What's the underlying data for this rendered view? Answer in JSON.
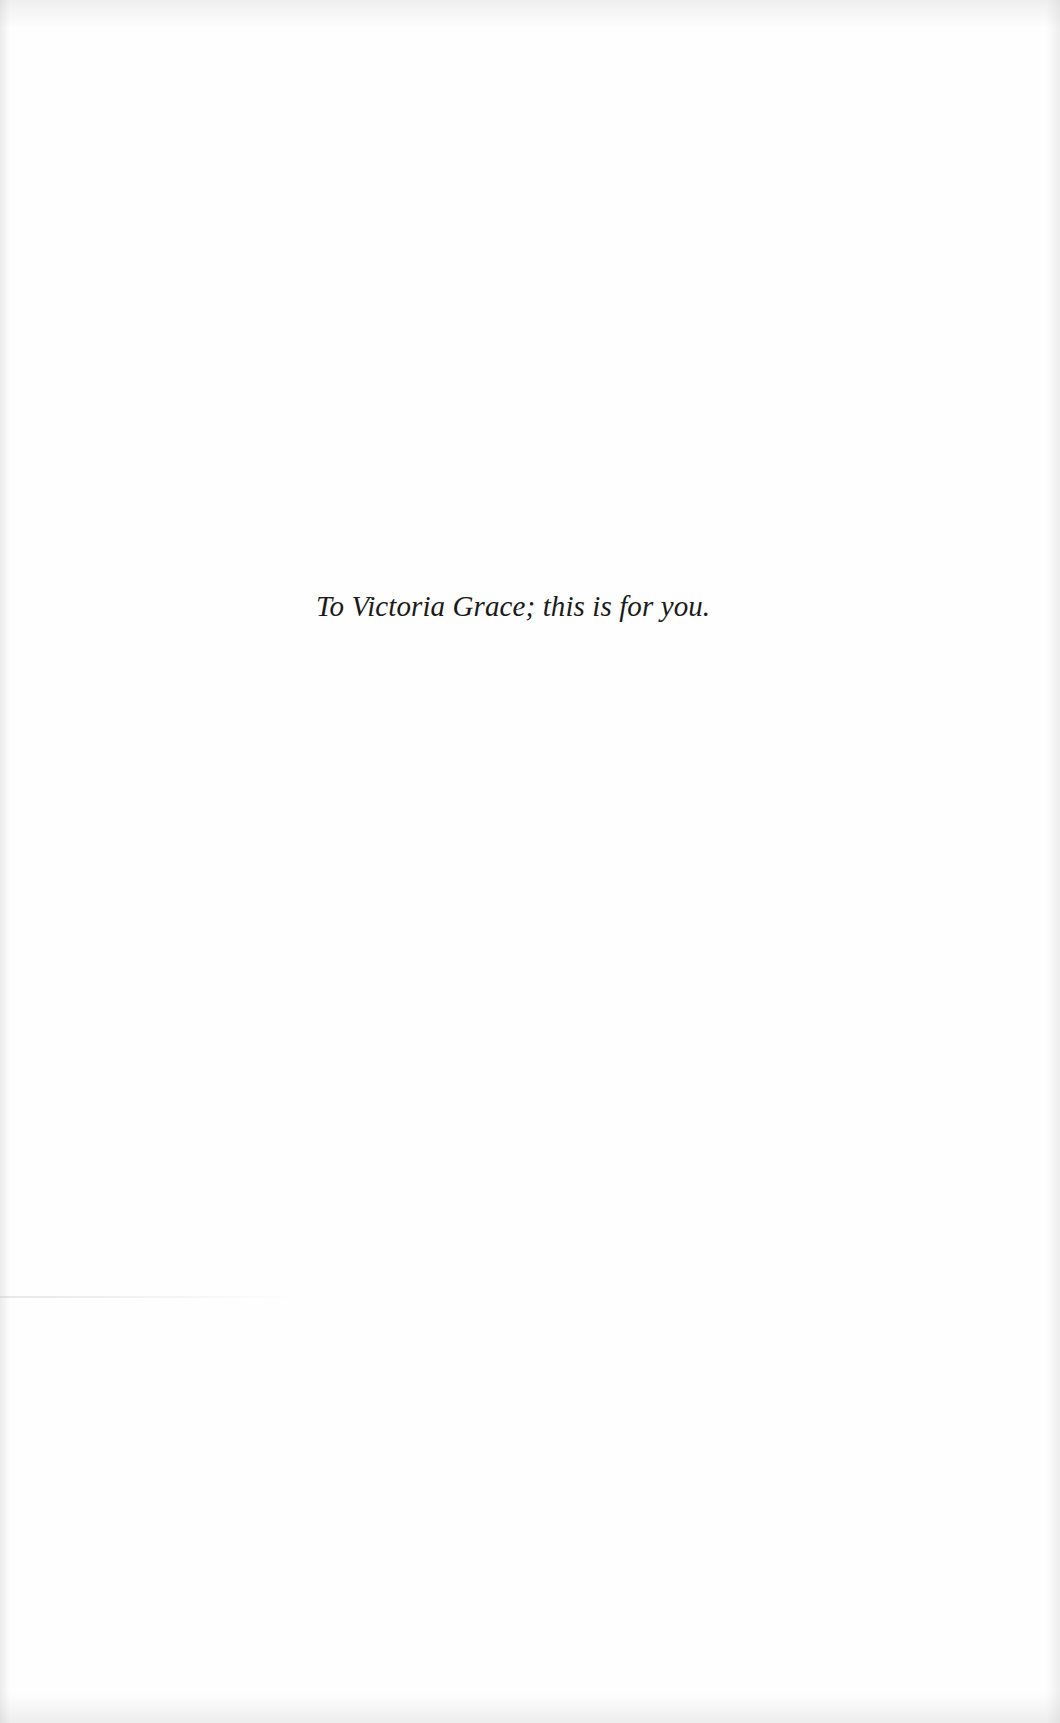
{
  "page": {
    "type": "dedication",
    "background_color": "#fefefe",
    "text_color": "#1a1a1a"
  },
  "dedication": {
    "text": "To Victoria Grace; this is for you."
  }
}
